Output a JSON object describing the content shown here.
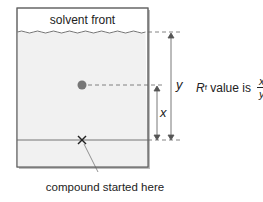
{
  "diagram": {
    "title": "solvent front",
    "caption": "compound started here",
    "labels": {
      "x": "x",
      "y": "y"
    },
    "formula": {
      "prefix": "R",
      "subscript": "f",
      "text": " value is ",
      "numerator": "x",
      "denominator": "y"
    },
    "colors": {
      "plate_fill": "#f2f2f2",
      "plate_border": "#666666",
      "spot": "#7a7a7a",
      "line": "#444444"
    }
  }
}
